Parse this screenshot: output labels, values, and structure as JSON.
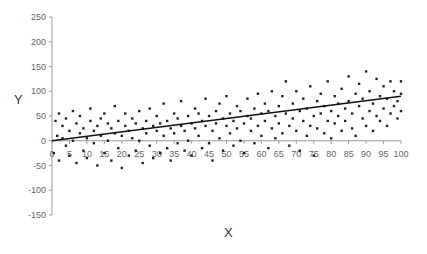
{
  "chart_data": {
    "type": "scatter",
    "title": "",
    "xlabel": "X",
    "ylabel": "Y",
    "xlim": [
      0,
      100
    ],
    "ylim": [
      -150,
      250
    ],
    "x_ticks": [
      0,
      5,
      10,
      15,
      20,
      25,
      30,
      35,
      40,
      45,
      50,
      55,
      60,
      65,
      70,
      75,
      80,
      85,
      90,
      95,
      100
    ],
    "y_ticks": [
      250,
      200,
      150,
      100,
      50,
      0,
      -50,
      -100,
      -150
    ],
    "grid": false,
    "legend": null,
    "trendline": {
      "type": "linear",
      "x": [
        0,
        100
      ],
      "y": [
        0,
        90
      ]
    },
    "series": [
      {
        "name": "data",
        "marker_color": "#222222",
        "points": [
          [
            0.5,
            -25
          ],
          [
            1,
            40
          ],
          [
            1.5,
            10
          ],
          [
            2,
            55
          ],
          [
            2,
            -40
          ],
          [
            3,
            5
          ],
          [
            3,
            30
          ],
          [
            4,
            -10
          ],
          [
            4,
            45
          ],
          [
            5,
            20
          ],
          [
            5,
            -30
          ],
          [
            6,
            60
          ],
          [
            6,
            0
          ],
          [
            7,
            35
          ],
          [
            7,
            -45
          ],
          [
            8,
            15
          ],
          [
            8,
            50
          ],
          [
            9,
            -20
          ],
          [
            9,
            25
          ],
          [
            10,
            5
          ],
          [
            10,
            -35
          ],
          [
            11,
            40
          ],
          [
            11,
            65
          ],
          [
            12,
            -5
          ],
          [
            12,
            20
          ],
          [
            13,
            -50
          ],
          [
            13,
            30
          ],
          [
            14,
            10
          ],
          [
            14,
            45
          ],
          [
            15,
            -25
          ],
          [
            15,
            55
          ],
          [
            16,
            0
          ],
          [
            16,
            35
          ],
          [
            17,
            -40
          ],
          [
            17,
            25
          ],
          [
            18,
            15
          ],
          [
            18,
            70
          ],
          [
            19,
            -15
          ],
          [
            19,
            40
          ],
          [
            20,
            10
          ],
          [
            20,
            -55
          ],
          [
            21,
            30
          ],
          [
            21,
            55
          ],
          [
            22,
            -30
          ],
          [
            22,
            20
          ],
          [
            23,
            5
          ],
          [
            23,
            45
          ],
          [
            24,
            -20
          ],
          [
            24,
            35
          ],
          [
            25,
            60
          ],
          [
            25,
            0
          ],
          [
            26,
            25
          ],
          [
            26,
            -45
          ],
          [
            27,
            40
          ],
          [
            27,
            15
          ],
          [
            28,
            -10
          ],
          [
            28,
            65
          ],
          [
            29,
            30
          ],
          [
            29,
            -35
          ],
          [
            30,
            20
          ],
          [
            30,
            50
          ],
          [
            31,
            -25
          ],
          [
            31,
            35
          ],
          [
            32,
            10
          ],
          [
            32,
            75
          ],
          [
            33,
            -15
          ],
          [
            33,
            40
          ],
          [
            34,
            25
          ],
          [
            34,
            -40
          ],
          [
            35,
            55
          ],
          [
            35,
            15
          ],
          [
            36,
            -5
          ],
          [
            36,
            45
          ],
          [
            37,
            30
          ],
          [
            37,
            80
          ],
          [
            38,
            -20
          ],
          [
            38,
            20
          ],
          [
            39,
            50
          ],
          [
            39,
            0
          ],
          [
            40,
            35
          ],
          [
            40,
            -30
          ],
          [
            41,
            65
          ],
          [
            41,
            25
          ],
          [
            42,
            10
          ],
          [
            42,
            55
          ],
          [
            43,
            -15
          ],
          [
            43,
            40
          ],
          [
            44,
            30
          ],
          [
            44,
            85
          ],
          [
            45,
            -5
          ],
          [
            45,
            50
          ],
          [
            46,
            20
          ],
          [
            46,
            -40
          ],
          [
            47,
            60
          ],
          [
            47,
            35
          ],
          [
            48,
            5
          ],
          [
            48,
            75
          ],
          [
            49,
            45
          ],
          [
            49,
            -20
          ],
          [
            50,
            30
          ],
          [
            50,
            90
          ],
          [
            51,
            15
          ],
          [
            51,
            55
          ],
          [
            52,
            -10
          ],
          [
            52,
            40
          ],
          [
            53,
            70
          ],
          [
            53,
            25
          ],
          [
            54,
            0
          ],
          [
            54,
            60
          ],
          [
            55,
            35
          ],
          [
            55,
            -25
          ],
          [
            56,
            50
          ],
          [
            56,
            85
          ],
          [
            57,
            20
          ],
          [
            57,
            45
          ],
          [
            58,
            -5
          ],
          [
            58,
            65
          ],
          [
            59,
            30
          ],
          [
            59,
            95
          ],
          [
            60,
            55
          ],
          [
            60,
            10
          ],
          [
            61,
            40
          ],
          [
            61,
            75
          ],
          [
            62,
            -15
          ],
          [
            62,
            60
          ],
          [
            63,
            25
          ],
          [
            63,
            100
          ],
          [
            64,
            50
          ],
          [
            64,
            5
          ],
          [
            65,
            70
          ],
          [
            65,
            35
          ],
          [
            66,
            90
          ],
          [
            66,
            15
          ],
          [
            67,
            55
          ],
          [
            67,
            120
          ],
          [
            68,
            30
          ],
          [
            68,
            -10
          ],
          [
            69,
            75
          ],
          [
            69,
            45
          ],
          [
            70,
            20
          ],
          [
            70,
            100
          ],
          [
            71,
            60
          ],
          [
            71,
            -20
          ],
          [
            72,
            85
          ],
          [
            72,
            40
          ],
          [
            73,
            10
          ],
          [
            73,
            65
          ],
          [
            74,
            110
          ],
          [
            74,
            30
          ],
          [
            75,
            50
          ],
          [
            75,
            -30
          ],
          [
            76,
            80
          ],
          [
            76,
            25
          ],
          [
            77,
            95
          ],
          [
            77,
            55
          ],
          [
            78,
            15
          ],
          [
            78,
            70
          ],
          [
            79,
            40
          ],
          [
            79,
            120
          ],
          [
            80,
            60
          ],
          [
            80,
            5
          ],
          [
            81,
            90
          ],
          [
            81,
            35
          ],
          [
            82,
            75
          ],
          [
            82,
            50
          ],
          [
            83,
            20
          ],
          [
            83,
            105
          ],
          [
            84,
            65
          ],
          [
            84,
            40
          ],
          [
            85,
            130
          ],
          [
            85,
            80
          ],
          [
            86,
            25
          ],
          [
            86,
            55
          ],
          [
            87,
            95
          ],
          [
            87,
            10
          ],
          [
            88,
            70
          ],
          [
            88,
            115
          ],
          [
            89,
            45
          ],
          [
            89,
            85
          ],
          [
            90,
            140
          ],
          [
            90,
            30
          ],
          [
            91,
            60
          ],
          [
            91,
            100
          ],
          [
            92,
            75
          ],
          [
            92,
            20
          ],
          [
            93,
            125
          ],
          [
            93,
            50
          ],
          [
            94,
            90
          ],
          [
            94,
            40
          ],
          [
            95,
            110
          ],
          [
            95,
            65
          ],
          [
            96,
            30
          ],
          [
            96,
            85
          ],
          [
            97,
            120
          ],
          [
            97,
            55
          ],
          [
            98,
            70
          ],
          [
            98,
            100
          ],
          [
            99,
            45
          ],
          [
            99,
            80
          ],
          [
            100,
            95
          ],
          [
            100,
            60
          ],
          [
            100,
            120
          ]
        ]
      }
    ]
  }
}
